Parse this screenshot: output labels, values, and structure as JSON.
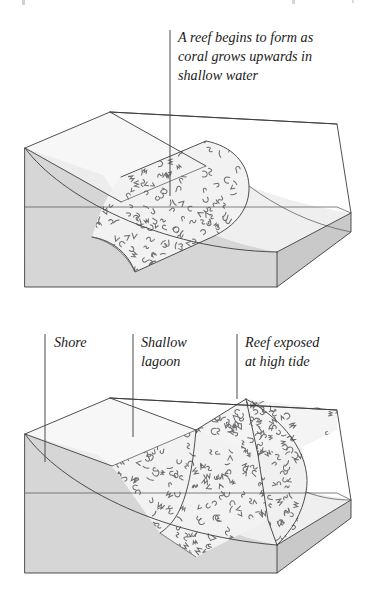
{
  "figure": {
    "panels": [
      {
        "id": "panel-upper",
        "stage_label": "A reef begins to form as coral grows upwards in shallow water",
        "annotations": [
          {
            "id": "annot-reef-forming",
            "lines": [
              "A reef begins to form as",
              "coral grows upwards in",
              "shallow water"
            ],
            "text_x": 178,
            "text_y": 42,
            "line_height": 19,
            "leader": {
              "x1": 170,
              "y1": 30,
              "x2": 170,
              "y2": 196
            }
          }
        ]
      },
      {
        "id": "panel-lower",
        "stage_label": "Reef and lagoon develop",
        "annotations": [
          {
            "id": "annot-shore",
            "lines": [
              "Shore"
            ],
            "text_x": 54,
            "text_y": 347,
            "line_height": 19,
            "leader": {
              "x1": 45,
              "y1": 334,
              "x2": 45,
              "y2": 462
            }
          },
          {
            "id": "annot-shallow-lagoon",
            "lines": [
              "Shallow",
              "lagoon"
            ],
            "text_x": 141,
            "text_y": 347,
            "line_height": 19,
            "leader": {
              "x1": 133,
              "y1": 334,
              "x2": 133,
              "y2": 437
            }
          },
          {
            "id": "annot-reef-exposed",
            "lines": [
              "Reef exposed",
              "at high tide"
            ],
            "text_x": 245,
            "text_y": 347,
            "line_height": 19,
            "leader": {
              "x1": 237,
              "y1": 334,
              "x2": 237,
              "y2": 399
            }
          }
        ]
      }
    ],
    "colors": {
      "land_surface": "#f4f4f4",
      "side_rock": "#d6d6d6",
      "sea_floor": "#efefef",
      "coral_fill": "#f2f2f2",
      "coral_mark": "#6e6e72",
      "outline": "#3c3c3c",
      "leader": "#4a4a4a",
      "text": "#1a1a1a",
      "background": "#ffffff"
    },
    "geometry": {
      "upper_block": {
        "back_left": [
          25,
          148
        ],
        "back_ridge": [
          110,
          112
        ],
        "back_right_top": [
          337,
          124
        ],
        "right_top": [
          337,
          124
        ],
        "right_lower": [
          351,
          232
        ],
        "front_right": [
          277,
          287
        ],
        "front_left": [
          25,
          287
        ],
        "left_face_top": [
          25,
          148
        ],
        "horizon_left": [
          25,
          207
        ],
        "horizon_right": [
          337,
          207
        ]
      },
      "lower_block": {
        "back_left": [
          25,
          434
        ],
        "back_ridge": [
          110,
          398
        ],
        "back_right_top": [
          337,
          410
        ],
        "right_lower": [
          351,
          518
        ],
        "front_right": [
          277,
          573
        ],
        "front_left": [
          25,
          573
        ],
        "horizon_left": [
          25,
          493
        ],
        "horizon_right": [
          337,
          493
        ],
        "reef_peak": [
          246,
          398
        ]
      }
    }
  },
  "coral_texture": {
    "glyph_types": [
      "hook-c",
      "hook-s",
      "tick-v",
      "dash",
      "squiggle-m",
      "arc-r"
    ],
    "density": "dense",
    "seed": 20240517,
    "upper_patch_count": 210,
    "lower_patch_count": 430
  }
}
